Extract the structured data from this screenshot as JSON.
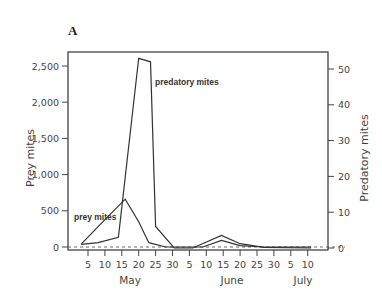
{
  "chart_data": {
    "type": "line",
    "panel_label": "A",
    "title": "",
    "xlabel": "",
    "x_ticks": [
      {
        "label": "5",
        "month": "May",
        "day": 5
      },
      {
        "label": "10",
        "month": "May",
        "day": 10
      },
      {
        "label": "15",
        "month": "May",
        "day": 15
      },
      {
        "label": "20",
        "month": "May",
        "day": 20
      },
      {
        "label": "25",
        "month": "May",
        "day": 25
      },
      {
        "label": "30",
        "month": "May",
        "day": 30
      },
      {
        "label": "5",
        "month": "June",
        "day": 5
      },
      {
        "label": "10",
        "month": "June",
        "day": 10
      },
      {
        "label": "15",
        "month": "June",
        "day": 15
      },
      {
        "label": "20",
        "month": "June",
        "day": 20
      },
      {
        "label": "25",
        "month": "June",
        "day": 25
      },
      {
        "label": "30",
        "month": "June",
        "day": 30
      },
      {
        "label": "5",
        "month": "July",
        "day": 5
      },
      {
        "label": "10",
        "month": "July",
        "day": 10
      }
    ],
    "month_labels": [
      "May",
      "June",
      "July"
    ],
    "y_left": {
      "label": "Prey mites",
      "ticks": [
        0,
        500,
        1000,
        1500,
        2000,
        2500
      ],
      "tick_labels": [
        "0",
        "500",
        "1,000",
        "1,500",
        "2,000",
        "2,500"
      ],
      "ylim": [
        0,
        2600
      ]
    },
    "y_right": {
      "label": "Predatory mites",
      "ticks": [
        0,
        10,
        20,
        30,
        40,
        50
      ],
      "tick_labels": [
        "0",
        "10",
        "20",
        "30",
        "40",
        "50"
      ],
      "ylim": [
        0,
        52
      ]
    },
    "series": [
      {
        "name": "prey mites",
        "axis": "left",
        "label": "prey mites",
        "points": [
          {
            "x_index": -0.4,
            "value": 40
          },
          {
            "x_index": 0.6,
            "value": 280
          },
          {
            "x_index": 2.2,
            "value": 660
          },
          {
            "x_index": 3.0,
            "value": 350
          },
          {
            "x_index": 3.6,
            "value": 60
          },
          {
            "x_index": 4.6,
            "value": 0
          },
          {
            "x_index": 6.8,
            "value": 0
          },
          {
            "x_index": 7.9,
            "value": 90
          },
          {
            "x_index": 9.0,
            "value": 20
          },
          {
            "x_index": 10.4,
            "value": 0
          },
          {
            "x_index": 13.2,
            "value": 0
          }
        ]
      },
      {
        "name": "predatory mites",
        "axis": "right",
        "label": "predatory mites",
        "points": [
          {
            "x_index": -0.4,
            "value": 1
          },
          {
            "x_index": 0.6,
            "value": 1.5
          },
          {
            "x_index": 1.8,
            "value": 3
          },
          {
            "x_index": 3.0,
            "value": 53
          },
          {
            "x_index": 3.7,
            "value": 52
          },
          {
            "x_index": 4.0,
            "value": 6
          },
          {
            "x_index": 5.1,
            "value": 0
          },
          {
            "x_index": 6.2,
            "value": 0
          },
          {
            "x_index": 7.9,
            "value": 3.5
          },
          {
            "x_index": 9.0,
            "value": 1.2
          },
          {
            "x_index": 10.4,
            "value": 0.2
          },
          {
            "x_index": 13.2,
            "value": 0
          }
        ]
      }
    ],
    "baseline": {
      "style": "dashed",
      "value": 0
    },
    "grid": false,
    "legend": "inline labels"
  }
}
